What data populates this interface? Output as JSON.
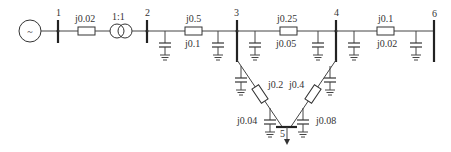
{
  "diagram": {
    "type": "power-system-single-line",
    "buses": [
      {
        "id": "1",
        "label": "1"
      },
      {
        "id": "2",
        "label": "2"
      },
      {
        "id": "3",
        "label": "3"
      },
      {
        "id": "4",
        "label": "4"
      },
      {
        "id": "5",
        "label": "5"
      },
      {
        "id": "6",
        "label": "6"
      }
    ],
    "generator": {
      "label": "~",
      "bus": "1"
    },
    "transformer": {
      "ratio": "1:1",
      "from": "1",
      "to": "2"
    },
    "branches": [
      {
        "from": "1",
        "to": "1t",
        "impedance": "j0.02"
      },
      {
        "from": "2",
        "to": "3",
        "impedance": "j0.5",
        "shunt": "j0.1"
      },
      {
        "from": "3",
        "to": "4",
        "impedance": "j0.25",
        "shunt": "j0.05"
      },
      {
        "from": "4",
        "to": "6",
        "impedance": "j0.1",
        "shunt": "j0.02"
      },
      {
        "from": "3",
        "to": "5",
        "impedance": "j0.2",
        "shunt": "j0.04"
      },
      {
        "from": "4",
        "to": "5",
        "impedance": "j0.4",
        "shunt": "j0.08"
      }
    ],
    "load": {
      "bus": "5"
    }
  }
}
